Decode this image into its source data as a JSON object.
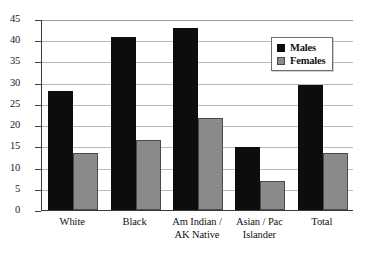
{
  "chart_data": {
    "type": "bar",
    "title": "",
    "subtitle": "",
    "xlabel": "",
    "ylabel": "",
    "ylim": [
      0,
      45
    ],
    "yticks": [
      "0",
      "5",
      "10",
      "15",
      "20",
      "25",
      "30",
      "35",
      "40",
      "45"
    ],
    "grid": true,
    "legend_position": "top-right-inside",
    "categories": [
      "White",
      "Black",
      "Am Indian / AK Native",
      "Asian / Pac Islander",
      "Total"
    ],
    "category_lines": [
      [
        "White",
        ""
      ],
      [
        "Black",
        ""
      ],
      [
        "Am Indian /",
        "AK Native"
      ],
      [
        "Asian / Pac",
        "Islander"
      ],
      [
        "Total",
        ""
      ]
    ],
    "series": [
      {
        "name": "Males",
        "color": "#0d0d0d",
        "values": [
          28.0,
          40.8,
          43.0,
          14.8,
          29.4
        ]
      },
      {
        "name": "Females",
        "color": "#8a8a8a",
        "values": [
          13.4,
          16.5,
          21.6,
          6.8,
          13.4
        ]
      }
    ]
  },
  "legend": {
    "items": [
      {
        "label": "Males",
        "swatch": "males"
      },
      {
        "label": "Females",
        "swatch": "females"
      }
    ]
  },
  "axis": {
    "y_max": 45,
    "y_min": 0,
    "y_step": 5
  }
}
